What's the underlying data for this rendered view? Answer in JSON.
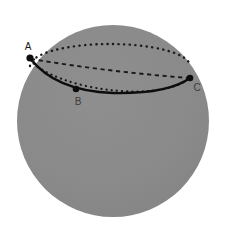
{
  "figure": {
    "background_color": "#ffffff",
    "sphere": {
      "name": "sphere",
      "center_x": 113,
      "center_y": 121,
      "radius": 96,
      "fill_color": "#8a8a8a",
      "edge_color": "#8a8a8a",
      "shading": "flat-gray"
    },
    "equator_ellipse": {
      "name": "dotted-equator-ellipse",
      "center_x": 110,
      "center_y": 66,
      "radius_x": 80,
      "radius_y": 22,
      "style": "dotted",
      "color": "#1a1a1a",
      "dot_size": 2.2
    },
    "chord_dashed": {
      "name": "dashed-chord-A-to-C",
      "from_x": 30,
      "from_y": 58,
      "to_x": 190,
      "to_y": 78,
      "style": "dashed",
      "color": "#1a1a1a"
    },
    "great_circle_arc": {
      "name": "solid-great-circle-arc",
      "style": "solid",
      "color": "#0d0d0d",
      "stroke_width": 2.2,
      "path": "M30,58 Q62,96 113,93 Q165,90 190,78"
    },
    "points": [
      {
        "id": "A",
        "label": "A",
        "x": 30,
        "y": 58,
        "label_x": 28,
        "label_y": 50,
        "dot_radius": 3.4,
        "color": "#0d0d0d"
      },
      {
        "id": "B",
        "label": "B",
        "x": 76,
        "y": 89,
        "label_x": 74,
        "label_y": 105,
        "dot_radius": 3.2,
        "color": "#0d0d0d"
      },
      {
        "id": "C",
        "label": "C",
        "x": 190,
        "y": 78,
        "label_x": 193,
        "label_y": 92,
        "dot_radius": 3.2,
        "color": "#0d0d0d"
      }
    ],
    "colors": {
      "sphere_gray": "#8a8a8a",
      "line_black": "#0d0d0d",
      "label_black": "#1a1a1a",
      "background_white": "#ffffff"
    }
  }
}
